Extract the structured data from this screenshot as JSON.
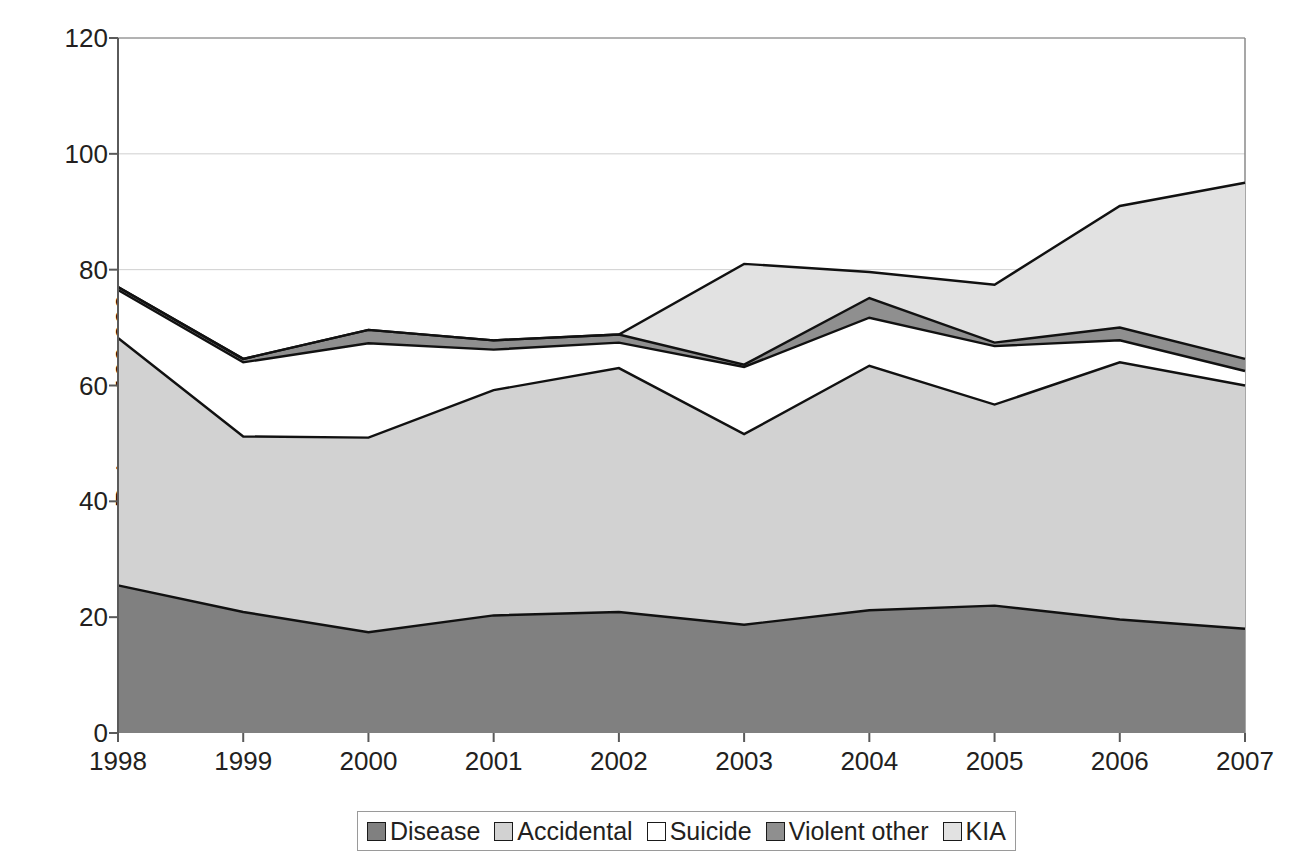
{
  "chart_data": {
    "type": "area",
    "stacked": true,
    "title": "",
    "subtitle": "",
    "xlabel": "",
    "ylabel": "Rate per 100,000",
    "categories": [
      "1998",
      "1999",
      "2000",
      "2001",
      "2002",
      "2003",
      "2004",
      "2005",
      "2006",
      "2007"
    ],
    "x": [
      1998,
      1999,
      2000,
      2001,
      2002,
      2003,
      2004,
      2005,
      2006,
      2007
    ],
    "ylim": [
      0,
      120
    ],
    "yticks": [
      0,
      20,
      40,
      60,
      80,
      100,
      120
    ],
    "grid": true,
    "legend_position": "bottom",
    "series": [
      {
        "name": "Disease",
        "color": "#808080",
        "values": [
          25.5,
          20.9,
          17.4,
          20.3,
          20.9,
          18.7,
          21.2,
          22.0,
          19.6,
          18.0
        ]
      },
      {
        "name": "Accidental",
        "color": "#d2d2d2",
        "values": [
          42.7,
          30.3,
          33.6,
          38.9,
          42.1,
          32.9,
          42.2,
          34.7,
          44.4,
          42.0
        ]
      },
      {
        "name": "Suicide",
        "color": "#ffffff",
        "values": [
          8.3,
          12.8,
          16.3,
          7.0,
          4.4,
          11.6,
          8.3,
          10.1,
          3.8,
          2.5
        ]
      },
      {
        "name": "Violent other",
        "color": "#8f8f8f",
        "values": [
          0.5,
          0.6,
          2.3,
          1.6,
          1.4,
          0.4,
          3.4,
          0.6,
          2.2,
          2.1
        ]
      },
      {
        "name": "KIA",
        "color": "#e2e2e2",
        "values": [
          0.0,
          0.0,
          0.0,
          0.0,
          0.0,
          17.4,
          4.5,
          10.0,
          21.0,
          30.4
        ]
      }
    ],
    "stack_tops": {
      "disease": [
        25.5,
        20.9,
        17.4,
        20.3,
        20.9,
        18.7,
        21.2,
        22.0,
        19.6,
        18.0
      ],
      "accidental": [
        68.2,
        51.2,
        51.0,
        59.2,
        63.0,
        51.6,
        63.4,
        56.7,
        64.0,
        60.0
      ],
      "suicide": [
        76.5,
        64.0,
        67.3,
        66.2,
        67.4,
        63.2,
        71.7,
        66.8,
        67.8,
        62.5
      ],
      "violent_other": [
        77.0,
        64.6,
        69.6,
        67.8,
        68.8,
        63.6,
        75.1,
        67.4,
        70.0,
        64.6
      ],
      "kia": [
        77.0,
        64.6,
        69.6,
        67.8,
        68.8,
        81.0,
        79.6,
        77.4,
        91.0,
        95.0
      ]
    }
  },
  "legend": {
    "items": [
      {
        "label": "Disease",
        "color": "#808080"
      },
      {
        "label": "Accidental",
        "color": "#d2d2d2"
      },
      {
        "label": "Suicide",
        "color": "#ffffff"
      },
      {
        "label": "Violent other",
        "color": "#8f8f8f"
      },
      {
        "label": "KIA",
        "color": "#e2e2e2"
      }
    ]
  },
  "axes": {
    "y_title": "Rate per 100,000",
    "y_labels": [
      "120",
      "100",
      "80",
      "60",
      "40",
      "20",
      "0"
    ],
    "x_labels": [
      "1998",
      "1999",
      "2000",
      "2001",
      "2002",
      "2003",
      "2004",
      "2005",
      "2006",
      "2007"
    ]
  }
}
